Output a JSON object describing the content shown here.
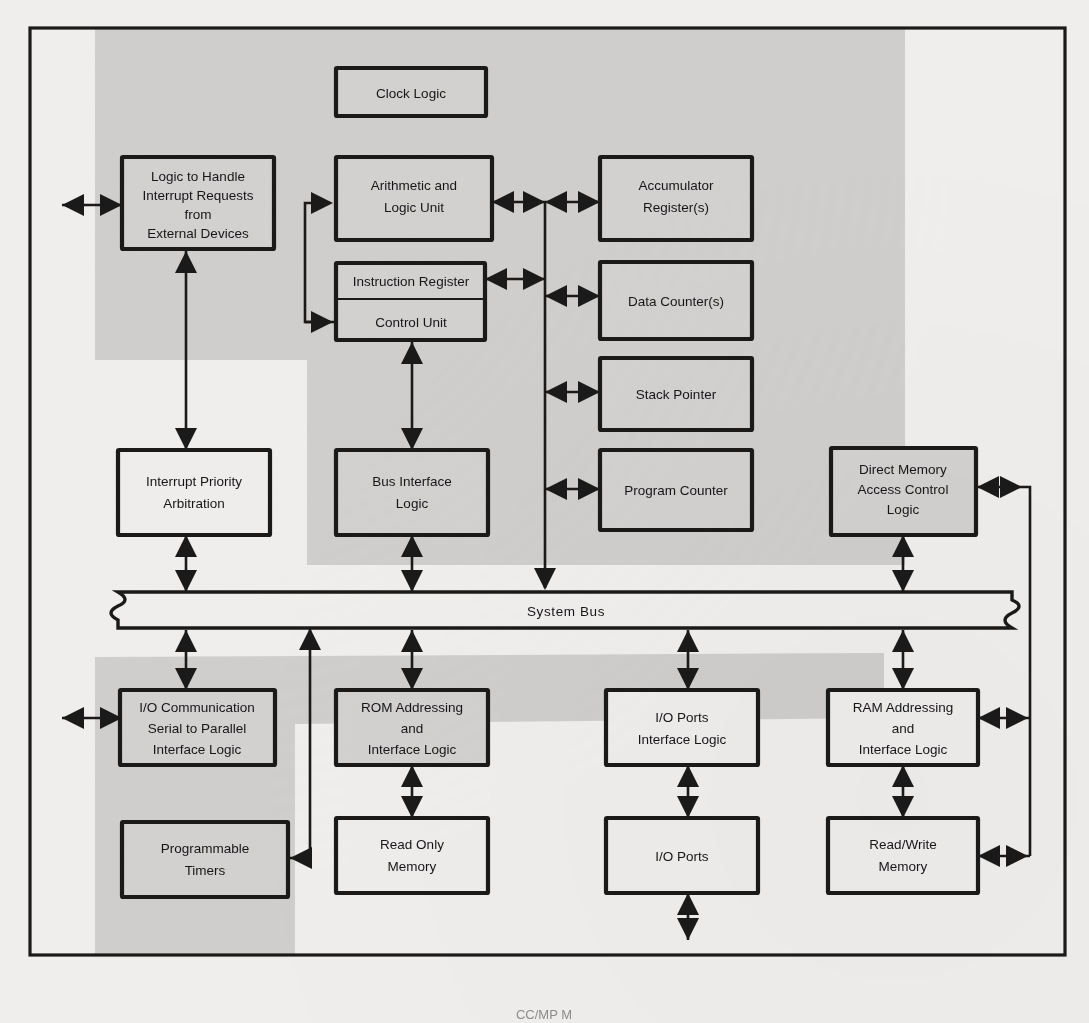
{
  "figure": {
    "caption_partial": "CC/MP M",
    "bus_label": "System Bus",
    "colors": {
      "paper": "#efeeec",
      "shade": "#cfcecc",
      "ink": "#1a1a1a",
      "box_fill": "#eeedeb"
    }
  },
  "blocks": [
    {
      "id": "clock-logic",
      "lines": [
        "Clock Logic"
      ]
    },
    {
      "id": "interrupt-handler",
      "lines": [
        "Logic to Handle",
        "Interrupt Requests",
        "from",
        "External Devices"
      ]
    },
    {
      "id": "alu",
      "lines": [
        "Arithmetic and",
        "Logic Unit"
      ]
    },
    {
      "id": "accumulator",
      "lines": [
        "Accumulator",
        "Register(s)"
      ]
    },
    {
      "id": "instruction-register",
      "lines": [
        "Instruction Register"
      ]
    },
    {
      "id": "control-unit",
      "lines": [
        "Control Unit"
      ]
    },
    {
      "id": "data-counter",
      "lines": [
        "Data Counter(s)"
      ]
    },
    {
      "id": "stack-pointer",
      "lines": [
        "Stack Pointer"
      ]
    },
    {
      "id": "interrupt-priority",
      "lines": [
        "Interrupt Priority",
        "Arbitration"
      ]
    },
    {
      "id": "bus-interface",
      "lines": [
        "Bus Interface",
        "Logic"
      ]
    },
    {
      "id": "program-counter",
      "lines": [
        "Program Counter"
      ]
    },
    {
      "id": "dma",
      "lines": [
        "Direct Memory",
        "Access Control",
        "Logic"
      ]
    },
    {
      "id": "io-communication",
      "lines": [
        "I/O Communication",
        "Serial to Parallel",
        "Interface Logic"
      ]
    },
    {
      "id": "rom-addressing",
      "lines": [
        "ROM Addressing",
        "and",
        "Interface Logic"
      ]
    },
    {
      "id": "io-ports-interface",
      "lines": [
        "I/O Ports",
        "Interface Logic"
      ]
    },
    {
      "id": "ram-addressing",
      "lines": [
        "RAM Addressing",
        "and",
        "Interface Logic"
      ]
    },
    {
      "id": "programmable-timers",
      "lines": [
        "Programmable",
        "Timers"
      ]
    },
    {
      "id": "read-only-memory",
      "lines": [
        "Read Only",
        "Memory"
      ]
    },
    {
      "id": "io-ports",
      "lines": [
        "I/O Ports"
      ]
    },
    {
      "id": "read-write-memory",
      "lines": [
        "Read/Write",
        "Memory"
      ]
    }
  ]
}
